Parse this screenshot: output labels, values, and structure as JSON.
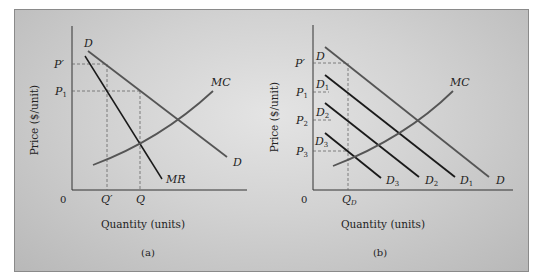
{
  "figure": {
    "panels": [
      {
        "id": "a",
        "caption": "(a)",
        "xlabel": "Quantity (units)",
        "ylabel": "Price ($/unit)",
        "origin_label": "0",
        "y_ticks": [
          {
            "label": "P′",
            "y": 64
          },
          {
            "label": "P",
            "sub": "1",
            "y": 91
          }
        ],
        "x_ticks": [
          {
            "label": "Q′",
            "x": 107
          },
          {
            "label": "Q",
            "x": 140
          }
        ],
        "curves": [
          {
            "name": "D",
            "label_start": "D",
            "label_end": "D",
            "color": "#555555"
          },
          {
            "name": "MR",
            "label_end": "MR",
            "color": "#1a1a1a"
          },
          {
            "name": "MC",
            "label_end": "MC",
            "color": "#555555"
          }
        ]
      },
      {
        "id": "b",
        "caption": "(b)",
        "xlabel": "Quantity (units)",
        "ylabel": "Price ($/unit)",
        "origin_label": "0",
        "y_ticks": [
          {
            "label": "P′",
            "y": 63
          },
          {
            "label": "P",
            "sub": "1",
            "y": 92
          },
          {
            "label": "P",
            "sub": "2",
            "y": 120
          },
          {
            "label": "P",
            "sub": "3",
            "y": 151
          }
        ],
        "x_ticks": [
          {
            "label": "Q",
            "sub": "D",
            "x": 348
          }
        ],
        "curves": [
          {
            "name": "D",
            "label_start": "D",
            "label_end": "D",
            "color": "#555555"
          },
          {
            "name": "D1",
            "label": "D",
            "sub": "1",
            "color": "#1a1a1a"
          },
          {
            "name": "D2",
            "label": "D",
            "sub": "2",
            "color": "#1a1a1a"
          },
          {
            "name": "D3",
            "label": "D",
            "sub": "3",
            "color": "#1a1a1a"
          },
          {
            "name": "MC",
            "label_end": "MC",
            "color": "#555555"
          }
        ]
      }
    ]
  },
  "text": {
    "a": {
      "caption": "(a)",
      "xlabel": "Quantity (units)",
      "ylabel": "Price ($/unit)",
      "zero": "0",
      "p_prime": "P′",
      "p1_main": "P",
      "p1_sub": "1",
      "q_prime": "Q′",
      "q": "Q",
      "d_top": "D",
      "d_end": "D",
      "mr": "MR",
      "mc": "MC"
    },
    "b": {
      "caption": "(b)",
      "xlabel": "Quantity (units)",
      "ylabel": "Price ($/unit)",
      "zero": "0",
      "p_prime": "P′",
      "p_main": "P",
      "sub1": "1",
      "sub2": "2",
      "sub3": "3",
      "qd_main": "Q",
      "qd_sub": "D",
      "d_top": "D",
      "d_end": "D",
      "d_main": "D",
      "mc": "MC"
    }
  }
}
